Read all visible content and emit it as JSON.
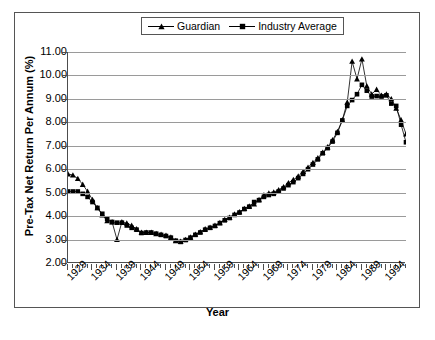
{
  "chart_data": {
    "type": "line",
    "title": "",
    "xlabel": "Year",
    "ylabel": "Pre-Tax Net Return Per Annum (%)",
    "xlim": [
      1929,
      1998
    ],
    "ylim": [
      2.0,
      11.0
    ],
    "ytick_labels": [
      "11.00",
      "10.00",
      "9.00",
      "8.00",
      "7.00",
      "6.00",
      "5.00",
      "4.00",
      "3.00",
      "2.00"
    ],
    "ytick_values": [
      11.0,
      10.0,
      9.0,
      8.0,
      7.0,
      6.0,
      5.0,
      4.0,
      3.0,
      2.0
    ],
    "xtick_labels": [
      "1929",
      "1934",
      "1939",
      "1944",
      "1949",
      "1954",
      "1959",
      "1964",
      "1969",
      "1974",
      "1979",
      "1984",
      "1989",
      "1994"
    ],
    "xtick_values": [
      1929,
      1934,
      1939,
      1944,
      1949,
      1954,
      1959,
      1964,
      1969,
      1974,
      1979,
      1984,
      1989,
      1994
    ],
    "grid": true,
    "legend_position": "top-center",
    "x": [
      1929,
      1930,
      1931,
      1932,
      1933,
      1934,
      1935,
      1936,
      1937,
      1938,
      1939,
      1940,
      1941,
      1942,
      1943,
      1944,
      1945,
      1946,
      1947,
      1948,
      1949,
      1950,
      1951,
      1952,
      1953,
      1954,
      1955,
      1956,
      1957,
      1958,
      1959,
      1960,
      1961,
      1962,
      1963,
      1964,
      1965,
      1966,
      1967,
      1968,
      1969,
      1970,
      1971,
      1972,
      1973,
      1974,
      1975,
      1976,
      1977,
      1978,
      1979,
      1980,
      1981,
      1982,
      1983,
      1984,
      1985,
      1986,
      1987,
      1988,
      1989,
      1990,
      1991,
      1992,
      1993,
      1994,
      1995,
      1996,
      1997,
      1998
    ],
    "series": [
      {
        "name": "Guardian",
        "marker": "triangle",
        "color": "#000000",
        "values": [
          5.8,
          5.75,
          5.6,
          5.35,
          5.05,
          4.7,
          4.35,
          4.05,
          3.8,
          3.75,
          3.0,
          3.75,
          3.7,
          3.6,
          3.45,
          3.3,
          3.3,
          3.3,
          3.25,
          3.22,
          3.18,
          3.1,
          2.95,
          2.92,
          3.0,
          3.1,
          3.22,
          3.33,
          3.45,
          3.52,
          3.6,
          3.72,
          3.85,
          3.95,
          4.08,
          4.18,
          4.32,
          4.42,
          4.52,
          4.7,
          4.9,
          4.98,
          5.02,
          5.12,
          5.25,
          5.42,
          5.55,
          5.7,
          5.9,
          6.08,
          6.28,
          6.48,
          6.72,
          6.95,
          7.25,
          7.6,
          8.1,
          8.85,
          10.6,
          9.85,
          10.7,
          9.55,
          9.2,
          9.4,
          9.15,
          9.2,
          9.0,
          8.6,
          8.1,
          7.5
        ]
      },
      {
        "name": "Industry Average",
        "marker": "square",
        "color": "#000000",
        "values": [
          5.05,
          5.05,
          5.05,
          4.95,
          4.82,
          4.6,
          4.35,
          4.1,
          3.88,
          3.75,
          3.72,
          3.72,
          3.6,
          3.5,
          3.42,
          3.28,
          3.3,
          3.3,
          3.25,
          3.2,
          3.15,
          3.08,
          2.95,
          2.9,
          2.98,
          3.08,
          3.2,
          3.3,
          3.42,
          3.5,
          3.58,
          3.7,
          3.82,
          3.92,
          4.05,
          4.15,
          4.3,
          4.4,
          4.6,
          4.68,
          4.82,
          4.9,
          4.95,
          5.05,
          5.18,
          5.32,
          5.45,
          5.62,
          5.8,
          6.0,
          6.2,
          6.42,
          6.68,
          6.9,
          7.18,
          7.55,
          8.08,
          8.7,
          8.95,
          9.2,
          9.6,
          9.35,
          9.1,
          9.12,
          9.1,
          9.15,
          8.8,
          8.7,
          7.9,
          7.15
        ]
      }
    ]
  },
  "legend": {
    "entries": [
      {
        "label": "Guardian",
        "marker": "triangle"
      },
      {
        "label": "Industry Average",
        "marker": "square"
      }
    ]
  }
}
